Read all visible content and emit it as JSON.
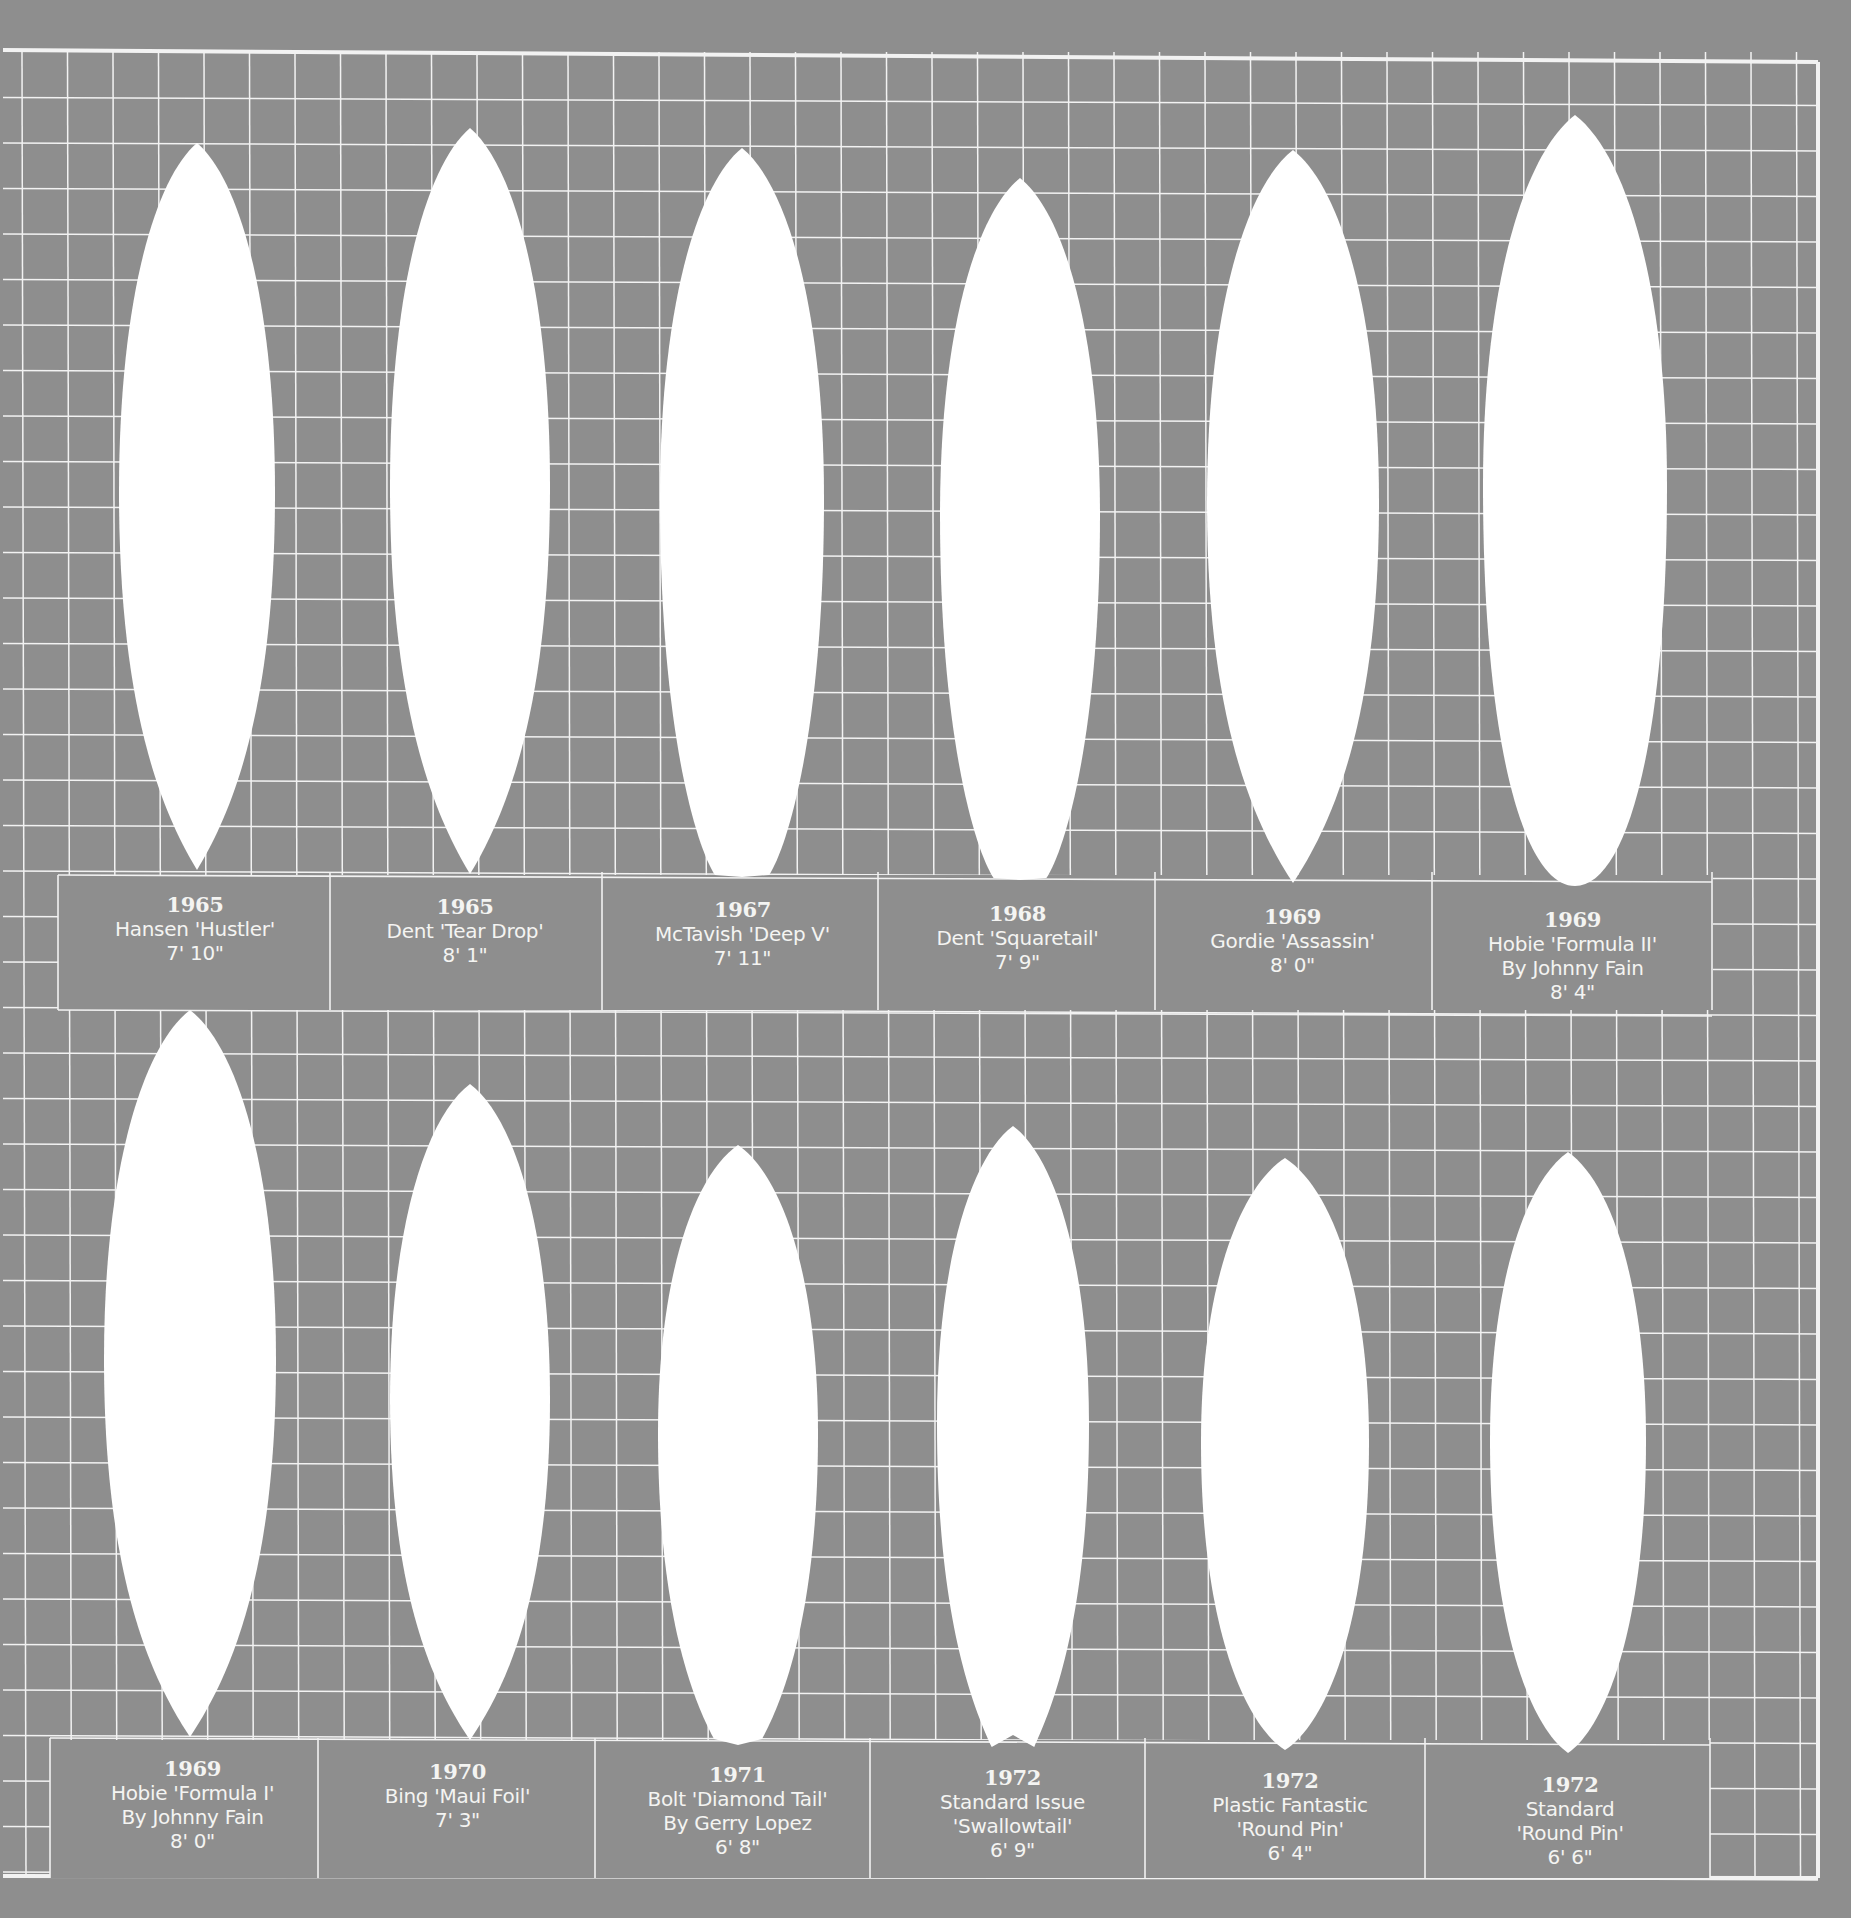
{
  "colors": {
    "background": "#8e8e8e",
    "grid_line": "#f2f2f2",
    "board": "#ffffff",
    "text": "#f4f4f2"
  },
  "rows": [
    {
      "boards": [
        {
          "year": "1965",
          "name": "Hansen 'Hustler'",
          "by": "",
          "length": "7' 10\"",
          "tail": "pin"
        },
        {
          "year": "1965",
          "name": "Dent 'Tear Drop'",
          "by": "",
          "length": "8' 1\"",
          "tail": "pin"
        },
        {
          "year": "1967",
          "name": "McTavish 'Deep V'",
          "by": "",
          "length": "7' 11\"",
          "tail": "square-v"
        },
        {
          "year": "1968",
          "name": "Dent 'Squaretail'",
          "by": "",
          "length": "7' 9\"",
          "tail": "square"
        },
        {
          "year": "1969",
          "name": "Gordie 'Assassin'",
          "by": "",
          "length": "8' 0\"",
          "tail": "pin"
        },
        {
          "year": "1969",
          "name": "Hobie 'Formula II'",
          "by": "By Johnny Fain",
          "length": "8' 4\"",
          "tail": "round"
        }
      ]
    },
    {
      "boards": [
        {
          "year": "1969",
          "name": "Hobie 'Formula I'",
          "by": "By Johnny Fain",
          "length": "8' 0\"",
          "tail": "pin"
        },
        {
          "year": "1970",
          "name": "Bing 'Maui Foil'",
          "by": "",
          "length": "7' 3\"",
          "tail": "pin"
        },
        {
          "year": "1971",
          "name": "Bolt 'Diamond Tail'",
          "by": "By Gerry Lopez",
          "length": "6' 8\"",
          "tail": "diamond"
        },
        {
          "year": "1972",
          "name": "Standard Issue",
          "by": "'Swallowtail'",
          "length": "6' 9\"",
          "tail": "swallow"
        },
        {
          "year": "1972",
          "name": "Plastic Fantastic",
          "by": "'Round Pin'",
          "length": "6' 4\"",
          "tail": "round-pin"
        },
        {
          "year": "1972",
          "name": "Standard",
          "by": "'Round Pin'",
          "length": "6' 6\"",
          "tail": "round-pin"
        }
      ]
    }
  ]
}
